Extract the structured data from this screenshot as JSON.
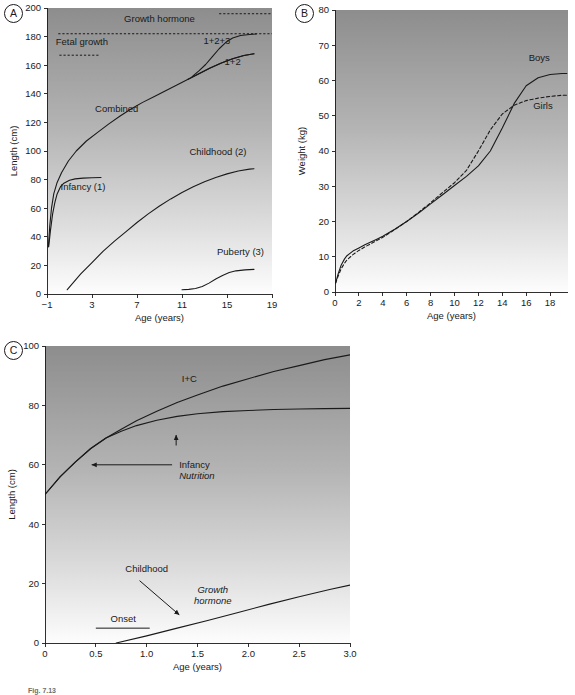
{
  "figure": {
    "caption_fragment": "Fig. 7.13",
    "panels": [
      "A",
      "B",
      "C"
    ]
  },
  "chart_data": [
    {
      "id": "panel-a",
      "type": "line",
      "panel_letter": "A",
      "title": "",
      "xlabel": "Age (years)",
      "ylabel": "Length (cm)",
      "xlim": [
        -1,
        19
      ],
      "ylim": [
        0,
        200
      ],
      "xticks": [
        -1,
        3,
        7,
        11,
        15,
        19
      ],
      "xticklabels": [
        "−1",
        "3",
        "7",
        "11",
        "15",
        "19"
      ],
      "yticks": [
        0,
        20,
        40,
        60,
        80,
        100,
        120,
        140,
        160,
        180,
        200
      ],
      "yticklabels": [
        "0",
        "20",
        "40",
        "60",
        "80",
        "100",
        "120",
        "140",
        "160",
        "180",
        "200"
      ],
      "grid": false,
      "legend": "inline-labels",
      "background": "vertical-gradient-dark-to-light",
      "series": [
        {
          "name": "Infancy (1)",
          "style": "solid",
          "label": "Infancy (1)",
          "label_x": 2.2,
          "label_y": 73,
          "points": [
            [
              -0.85,
              33
            ],
            [
              -0.7,
              44
            ],
            [
              -0.5,
              56
            ],
            [
              -0.3,
              64
            ],
            [
              -0.1,
              70
            ],
            [
              0.2,
              75
            ],
            [
              0.5,
              77.5
            ],
            [
              1.0,
              79.5
            ],
            [
              1.5,
              80.5
            ],
            [
              2.2,
              81
            ],
            [
              3.0,
              81.3
            ],
            [
              3.8,
              81.5
            ]
          ]
        },
        {
          "name": "Childhood (2)",
          "style": "solid",
          "label": "Childhood (2)",
          "label_x": 14.2,
          "label_y": 97,
          "points": [
            [
              0.8,
              3
            ],
            [
              2,
              14
            ],
            [
              3,
              22
            ],
            [
              4,
              30
            ],
            [
              5,
              37
            ],
            [
              6,
              43.5
            ],
            [
              7,
              50
            ],
            [
              8,
              56
            ],
            [
              9,
              61.5
            ],
            [
              10,
              66.5
            ],
            [
              11,
              71
            ],
            [
              12,
              75
            ],
            [
              13,
              78.5
            ],
            [
              14,
              81.5
            ],
            [
              15,
              84
            ],
            [
              16,
              86
            ],
            [
              17,
              87.3
            ],
            [
              17.4,
              87.6
            ]
          ]
        },
        {
          "name": "Puberty (3)",
          "style": "solid",
          "label": "Puberty (3)",
          "label_x": 16.2,
          "label_y": 27,
          "points": [
            [
              11,
              3
            ],
            [
              11.6,
              3.2
            ],
            [
              12.2,
              3.8
            ],
            [
              12.8,
              5.2
            ],
            [
              13.4,
              7.6
            ],
            [
              14,
              10.5
            ],
            [
              14.6,
              13
            ],
            [
              15.2,
              15
            ],
            [
              15.8,
              16.2
            ],
            [
              16.6,
              16.9
            ],
            [
              17.4,
              17.2
            ]
          ]
        },
        {
          "name": "Combined",
          "style": "solid",
          "label": "Combined",
          "label_x": 5.2,
          "label_y": 127,
          "points": [
            [
              -0.88,
              33
            ],
            [
              -0.75,
              48
            ],
            [
              -0.6,
              60
            ],
            [
              -0.4,
              70
            ],
            [
              -0.1,
              78
            ],
            [
              0.3,
              85
            ],
            [
              0.9,
              93
            ],
            [
              1.6,
              100
            ],
            [
              2.5,
              107
            ],
            [
              3.5,
              113
            ],
            [
              4.5,
              119
            ],
            [
              5.5,
              124.5
            ],
            [
              6.5,
              129.5
            ],
            [
              7.5,
              134
            ],
            [
              8.5,
              138
            ],
            [
              9.5,
              142
            ],
            [
              10.5,
              146
            ],
            [
              11.5,
              150
            ],
            [
              12.5,
              154
            ],
            [
              13.5,
              158
            ],
            [
              14.5,
              161.5
            ],
            [
              15.5,
              164.5
            ],
            [
              16.5,
              166.8
            ],
            [
              17.4,
              168
            ]
          ]
        },
        {
          "name": "1+2+3",
          "style": "solid",
          "label": "1+2+3",
          "label_x": 14.1,
          "label_y": 175,
          "points": [
            [
              11.9,
              152
            ],
            [
              12.5,
              156
            ],
            [
              13.1,
              160.5
            ],
            [
              13.7,
              166
            ],
            [
              14.3,
              171.5
            ],
            [
              14.9,
              176
            ],
            [
              15.5,
              179
            ],
            [
              16.2,
              180.8
            ],
            [
              17,
              181.5
            ],
            [
              17.6,
              181.8
            ]
          ]
        },
        {
          "name": "1+2",
          "style": "solid",
          "label": "1+2",
          "label_x": 15.5,
          "label_y": 160,
          "points": [
            [
              11.5,
              150
            ],
            [
              12.5,
              154
            ],
            [
              13.5,
              158
            ],
            [
              14.5,
              161.5
            ],
            [
              15.5,
              164.5
            ],
            [
              16.5,
              166.8
            ],
            [
              17.4,
              168
            ]
          ]
        }
      ],
      "annotations": [
        {
          "name": "sex-steroids",
          "text": "Sex steroids",
          "style": "dashed-line-with-label",
          "label_x": 16.3,
          "label_y": 200,
          "line_x0": 14.3,
          "line_x1": 19,
          "line_y": 196
        },
        {
          "name": "growth-hormone",
          "text": "Growth hormone",
          "style": "dashed-line-with-label",
          "label_x": 9.0,
          "label_y": 190,
          "line_x0": 0.0,
          "line_x1": 19,
          "line_y": 182
        },
        {
          "name": "fetal-growth",
          "text": "Fetal growth",
          "style": "dashed-line-with-label",
          "label_x": 2.1,
          "label_y": 174,
          "line_x0": 0.1,
          "line_x1": 3.6,
          "line_y": 167
        }
      ]
    },
    {
      "id": "panel-b",
      "type": "line",
      "panel_letter": "B",
      "title": "",
      "xlabel": "Age (years)",
      "ylabel": "Weight (kg)",
      "xlim": [
        0,
        19.5
      ],
      "ylim": [
        0,
        80
      ],
      "xticks": [
        0,
        2,
        4,
        6,
        8,
        10,
        12,
        14,
        16,
        18
      ],
      "xticklabels": [
        "0",
        "2",
        "4",
        "6",
        "8",
        "10",
        "12",
        "14",
        "16",
        "18"
      ],
      "yticks": [
        0,
        10,
        20,
        30,
        40,
        50,
        60,
        70,
        80
      ],
      "yticklabels": [
        "0",
        "10",
        "20",
        "30",
        "40",
        "50",
        "60",
        "70",
        "80"
      ],
      "grid": false,
      "legend": "inline-labels",
      "background": "vertical-gradient-dark-to-light",
      "series": [
        {
          "name": "Boys",
          "style": "solid",
          "label": "Boys",
          "label_x": 17.1,
          "label_y": 65.5,
          "points": [
            [
              0.05,
              2.5
            ],
            [
              0.25,
              5
            ],
            [
              0.5,
              7.5
            ],
            [
              0.8,
              9.4
            ],
            [
              1,
              10.3
            ],
            [
              1.5,
              11.6
            ],
            [
              2,
              12.5
            ],
            [
              2.5,
              13.4
            ],
            [
              3,
              14.2
            ],
            [
              3.5,
              15
            ],
            [
              4,
              15.8
            ],
            [
              5,
              17.8
            ],
            [
              6,
              20
            ],
            [
              7,
              22.4
            ],
            [
              8,
              25
            ],
            [
              9,
              27.6
            ],
            [
              10,
              30.2
            ],
            [
              11,
              32.8
            ],
            [
              12,
              35.8
            ],
            [
              13,
              40
            ],
            [
              14,
              46.5
            ],
            [
              15,
              53.5
            ],
            [
              16,
              58.5
            ],
            [
              17,
              60.8
            ],
            [
              18,
              61.7
            ],
            [
              19,
              62
            ],
            [
              19.4,
              62
            ]
          ]
        },
        {
          "name": "Girls",
          "style": "dashed",
          "label": "Girls",
          "label_x": 17.4,
          "label_y": 52,
          "points": [
            [
              0.05,
              2.5
            ],
            [
              0.25,
              4.4
            ],
            [
              0.5,
              6.5
            ],
            [
              0.8,
              8.2
            ],
            [
              1,
              9.1
            ],
            [
              1.5,
              10.6
            ],
            [
              2,
              11.8
            ],
            [
              2.5,
              12.8
            ],
            [
              3,
              13.7
            ],
            [
              3.5,
              14.6
            ],
            [
              4,
              15.5
            ],
            [
              5,
              17.7
            ],
            [
              6,
              20
            ],
            [
              7,
              22.6
            ],
            [
              8,
              25.3
            ],
            [
              9,
              28.2
            ],
            [
              10,
              31
            ],
            [
              11,
              34.5
            ],
            [
              12,
              40
            ],
            [
              13,
              46
            ],
            [
              14,
              50.5
            ],
            [
              15,
              53
            ],
            [
              16,
              54.3
            ],
            [
              17,
              55
            ],
            [
              18,
              55.5
            ],
            [
              19,
              55.8
            ],
            [
              19.4,
              55.8
            ]
          ]
        }
      ],
      "annotations": []
    },
    {
      "id": "panel-c",
      "type": "line",
      "panel_letter": "C",
      "title": "",
      "xlabel": "Age (years)",
      "ylabel": "Length (cm)",
      "xlim": [
        0,
        3.0
      ],
      "ylim": [
        0,
        100
      ],
      "xticks": [
        0,
        0.5,
        1.0,
        1.5,
        2.0,
        2.5,
        3.0
      ],
      "xticklabels": [
        "0",
        "0.5",
        "1.0",
        "1.5",
        "2.0",
        "2.5",
        "3.0"
      ],
      "yticks": [
        0,
        20,
        40,
        60,
        80,
        100
      ],
      "yticklabels": [
        "0",
        "20",
        "40",
        "60",
        "80",
        "100"
      ],
      "grid": false,
      "legend": "inline-labels",
      "background": "vertical-gradient-dark-to-light",
      "series": [
        {
          "name": "I+C",
          "style": "solid",
          "label": "I+C",
          "label_x": 1.42,
          "label_y": 88,
          "points": [
            [
              0,
              50
            ],
            [
              0.15,
              56
            ],
            [
              0.3,
              61
            ],
            [
              0.45,
              65.5
            ],
            [
              0.6,
              69
            ],
            [
              0.75,
              72
            ],
            [
              0.9,
              74.8
            ],
            [
              1.1,
              78
            ],
            [
              1.3,
              81
            ],
            [
              1.5,
              83.5
            ],
            [
              1.75,
              86.5
            ],
            [
              2,
              89
            ],
            [
              2.25,
              91.4
            ],
            [
              2.5,
              93.4
            ],
            [
              2.75,
              95.4
            ],
            [
              3,
              97
            ]
          ]
        },
        {
          "name": "Infancy",
          "style": "solid",
          "label": "",
          "points": [
            [
              0,
              50
            ],
            [
              0.15,
              56
            ],
            [
              0.3,
              61
            ],
            [
              0.45,
              65.5
            ],
            [
              0.6,
              69
            ],
            [
              0.75,
              71.3
            ],
            [
              0.9,
              73.2
            ],
            [
              1.1,
              75
            ],
            [
              1.3,
              76.3
            ],
            [
              1.5,
              77.2
            ],
            [
              1.75,
              77.9
            ],
            [
              2,
              78.3
            ],
            [
              2.25,
              78.6
            ],
            [
              2.5,
              78.8
            ],
            [
              2.75,
              78.9
            ],
            [
              3,
              79
            ]
          ]
        },
        {
          "name": "Childhood",
          "style": "solid",
          "label": "",
          "points": [
            [
              0.7,
              0
            ],
            [
              1.0,
              2.4
            ],
            [
              1.3,
              5
            ],
            [
              1.6,
              7.6
            ],
            [
              1.9,
              10.3
            ],
            [
              2.2,
              13
            ],
            [
              2.5,
              15.6
            ],
            [
              2.8,
              18
            ],
            [
              3.0,
              19.5
            ]
          ]
        }
      ],
      "annotations": [
        {
          "name": "infancy-nutrition",
          "text": "Infancy",
          "text2": "Nutrition",
          "style": "two-arrows",
          "label_x": 1.32,
          "label_y": 60,
          "arrow_up_x": 1.29,
          "arrow_up_y0": 66.5,
          "arrow_up_y1": 70,
          "arrow_left_x0": 1.25,
          "arrow_left_x1": 0.46,
          "arrow_left_y": 60
        },
        {
          "name": "childhood-arrow",
          "text": "Childhood",
          "style": "diagonal-arrow",
          "label_x": 1.0,
          "label_y": 24,
          "arrow_x0": 0.93,
          "arrow_y0": 21,
          "arrow_x1": 1.32,
          "arrow_y1": 9.5
        },
        {
          "name": "growth-hormone-italic",
          "text": "Growth",
          "text2": "hormone",
          "style": "italic-label",
          "label_x": 1.65,
          "label_y": 17
        },
        {
          "name": "onset",
          "text": "Onset",
          "style": "label-over-line",
          "label_x": 0.77,
          "label_y": 7,
          "line_x0": 0.5,
          "line_x1": 1.03,
          "line_y": 5
        }
      ]
    }
  ]
}
